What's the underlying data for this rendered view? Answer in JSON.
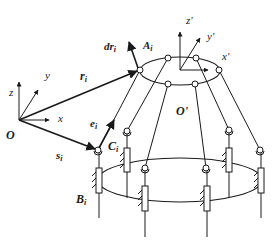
{
  "diagram": {
    "type": "parallel-mechanism-kinematics",
    "colors": {
      "stroke": "#1a1a1a",
      "background": "#ffffff"
    },
    "labels": {
      "world_origin": "O",
      "world_x": "x",
      "world_y": "y",
      "world_z": "z",
      "vector_r": "r",
      "vector_r_sub": "i",
      "vector_dr": "dr",
      "vector_dr_sub": "i",
      "vector_e": "e",
      "vector_e_sub": "i",
      "vector_s": "s",
      "vector_s_sub": "i",
      "joint_A": "A",
      "joint_A_sub": "i",
      "joint_B": "B",
      "joint_B_sub": "i",
      "joint_C": "C",
      "joint_C_sub": "i",
      "platform_origin": "O'",
      "platform_x": "x'",
      "platform_y": "y'",
      "platform_z": "z'"
    },
    "moving_platform": {
      "shape": "ellipse",
      "joints": 6
    },
    "base": {
      "shape": "ellipse",
      "legs": 6,
      "actuator": "prismatic-slider"
    }
  }
}
